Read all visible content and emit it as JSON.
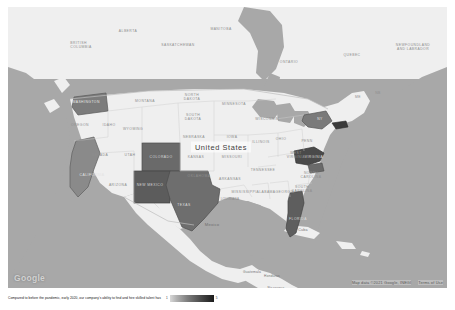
{
  "map": {
    "watermark": "Google",
    "attribution": {
      "data": "Map data ©2021 Google, INEGI",
      "terms": "Terms of Use"
    },
    "country_labels": [
      {
        "name": "United States",
        "x": 213,
        "y": 140,
        "primary": true
      },
      {
        "name": "Mexico",
        "x": 204,
        "y": 217,
        "primary": false
      }
    ],
    "place_labels": [
      {
        "name": "Cuba",
        "x": 295,
        "y": 223
      },
      {
        "name": "Guatemala",
        "x": 242,
        "y": 265
      },
      {
        "name": "Honduras",
        "x": 260,
        "y": 269
      },
      {
        "name": "Nicaragua",
        "x": 264,
        "y": 281
      }
    ],
    "province_labels": [
      {
        "name": "BRITISH COLUMBIA",
        "x": 73,
        "y": 38
      },
      {
        "name": "ALBERTA",
        "x": 120,
        "y": 24
      },
      {
        "name": "SASKATCHEWAN",
        "x": 170,
        "y": 38
      },
      {
        "name": "MANITOBA",
        "x": 213,
        "y": 22
      },
      {
        "name": "ONTARIO",
        "x": 281,
        "y": 55
      },
      {
        "name": "QUEBEC",
        "x": 344,
        "y": 48
      },
      {
        "name": "NEWFOUNDLAND AND LABRADOR",
        "x": 405,
        "y": 40
      }
    ],
    "state_labels": [
      {
        "name": "WASHINGTON",
        "x": 78,
        "y": 95
      },
      {
        "name": "OREGON",
        "x": 72,
        "y": 118
      },
      {
        "name": "IDAHO",
        "x": 101,
        "y": 118
      },
      {
        "name": "MONTANA",
        "x": 137,
        "y": 94
      },
      {
        "name": "NORTH DAKOTA",
        "x": 184,
        "y": 90
      },
      {
        "name": "SOUTH DAKOTA",
        "x": 185,
        "y": 110
      },
      {
        "name": "MINNESOTA",
        "x": 226,
        "y": 97
      },
      {
        "name": "WISCONSIN",
        "x": 259,
        "y": 112
      },
      {
        "name": "WYOMING",
        "x": 125,
        "y": 122
      },
      {
        "name": "NEVADA",
        "x": 92,
        "y": 148
      },
      {
        "name": "UTAH",
        "x": 122,
        "y": 148
      },
      {
        "name": "COLORADO",
        "x": 157,
        "y": 148
      },
      {
        "name": "NEBRASKA",
        "x": 186,
        "y": 130
      },
      {
        "name": "IOWA",
        "x": 224,
        "y": 130
      },
      {
        "name": "ILLINOIS",
        "x": 253,
        "y": 135
      },
      {
        "name": "KANSAS",
        "x": 188,
        "y": 150
      },
      {
        "name": "MISSOURI",
        "x": 224,
        "y": 150
      },
      {
        "name": "CALIFORNIA",
        "x": 84,
        "y": 168
      },
      {
        "name": "ARIZONA",
        "x": 110,
        "y": 178
      },
      {
        "name": "NEW MEXICO",
        "x": 140,
        "y": 176
      },
      {
        "name": "OKLAHOMA",
        "x": 191,
        "y": 169
      },
      {
        "name": "ARKANSAS",
        "x": 222,
        "y": 172
      },
      {
        "name": "TENNESSEE",
        "x": 255,
        "y": 163
      },
      {
        "name": "MISSISSIPPI",
        "x": 238,
        "y": 185
      },
      {
        "name": "ALABAMA",
        "x": 258,
        "y": 185
      },
      {
        "name": "TEXAS",
        "x": 173,
        "y": 198
      },
      {
        "name": "LOUISIANA",
        "x": 222,
        "y": 192
      },
      {
        "name": "GEORGIA",
        "x": 277,
        "y": 185
      },
      {
        "name": "FLORIDA",
        "x": 292,
        "y": 212
      },
      {
        "name": "OHIO",
        "x": 273,
        "y": 132
      },
      {
        "name": "PENN",
        "x": 299,
        "y": 134
      },
      {
        "name": "WEST VIRGINIA",
        "x": 288,
        "y": 150
      },
      {
        "name": "VIRGINIA",
        "x": 303,
        "y": 152
      },
      {
        "name": "NORTH CAROLINA",
        "x": 303,
        "y": 168
      },
      {
        "name": "SOUTH CAROLINA",
        "x": 294,
        "y": 180
      },
      {
        "name": "NY",
        "x": 312,
        "y": 112
      },
      {
        "name": "ME",
        "x": 350,
        "y": 92
      },
      {
        "name": "NB",
        "x": 370,
        "y": 88
      }
    ],
    "highlighted_states": [
      "Washington",
      "California",
      "Colorado",
      "New Mexico",
      "Texas",
      "Florida",
      "New York",
      "Massachusetts",
      "Virginia"
    ]
  },
  "caption": {
    "text": "Compared to before the pandemic, early 2020, our company's ability to find and hire skilled talent has",
    "legend_min": "1",
    "legend_max": "5"
  },
  "colors": {
    "ocean": "#a8a8a8",
    "land": "#efefef",
    "highlight_dark": "#6f6f6f",
    "highlight_darker": "#5a5a5a"
  }
}
